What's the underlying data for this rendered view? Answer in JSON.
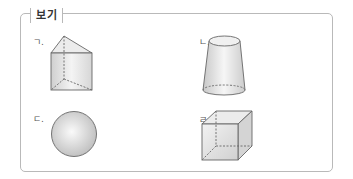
{
  "title": "보기",
  "items": [
    {
      "label": "ㄱ.",
      "shape": "triangular-prism"
    },
    {
      "label": "ㄴ.",
      "shape": "truncated-cone"
    },
    {
      "label": "ㄷ.",
      "shape": "sphere"
    },
    {
      "label": "ㄹ.",
      "shape": "cube"
    }
  ],
  "colors": {
    "border": "#b9b9b9",
    "edge": "#666666",
    "fill_light": "#f2f2f2",
    "fill_dark": "#cfcfcf"
  }
}
